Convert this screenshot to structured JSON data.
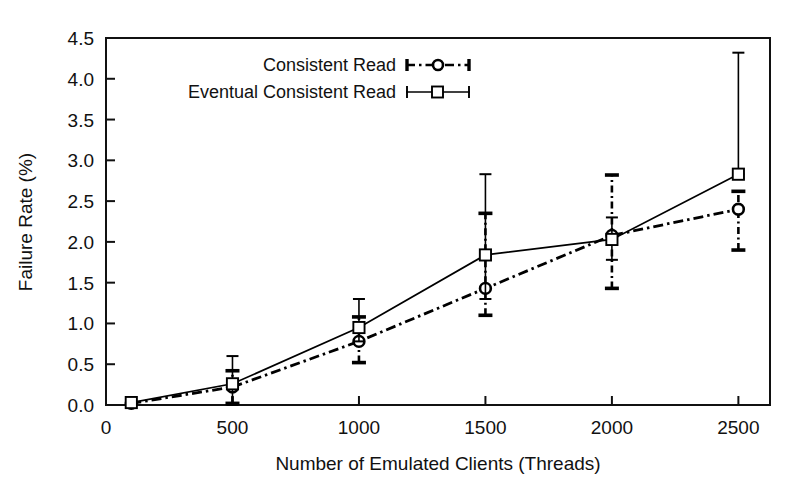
{
  "chart_data": {
    "type": "line",
    "title": "",
    "subtitle": "",
    "xlabel": "Number of Emulated Clients (Threads)",
    "ylabel": "Failure Rate (%)",
    "xlim": [
      0,
      2625
    ],
    "ylim": [
      0.0,
      4.5
    ],
    "xticks": [
      0,
      500,
      1000,
      1500,
      2000,
      2500
    ],
    "xtick_labels": [
      "0",
      "500",
      "1000",
      "1500",
      "2000",
      "2500"
    ],
    "yticks": [
      0.0,
      0.5,
      1.0,
      1.5,
      2.0,
      2.5,
      3.0,
      3.5,
      4.0,
      4.5
    ],
    "ytick_labels": [
      "0.0",
      "0.5",
      "1.0",
      "1.5",
      "2.0",
      "2.5",
      "3.0",
      "3.5",
      "4.0",
      "4.5"
    ],
    "grid": false,
    "legend_position": "top-center",
    "x": [
      100,
      500,
      1000,
      1500,
      2000,
      2500
    ],
    "series": [
      {
        "name": "Consistent Read",
        "marker": "circle-open",
        "linestyle": "dash-dot",
        "color": "#000000",
        "values": [
          0.02,
          0.22,
          0.78,
          1.43,
          2.08,
          2.4
        ],
        "err_low": [
          0.02,
          0.02,
          0.52,
          1.1,
          1.43,
          1.9
        ],
        "err_high": [
          0.02,
          0.42,
          1.08,
          2.35,
          2.82,
          2.62
        ]
      },
      {
        "name": "Eventual Consistent Read",
        "marker": "square-open",
        "linestyle": "solid",
        "color": "#000000",
        "values": [
          0.03,
          0.26,
          0.95,
          1.84,
          2.03,
          2.83
        ],
        "err_low": [
          0.03,
          0.0,
          0.78,
          1.3,
          1.78,
          2.83
        ],
        "err_high": [
          0.03,
          0.6,
          1.3,
          2.83,
          2.3,
          4.32
        ]
      }
    ]
  },
  "legend": {
    "entries": [
      {
        "label": "Consistent Read"
      },
      {
        "label": "Eventual Consistent Read"
      }
    ]
  }
}
